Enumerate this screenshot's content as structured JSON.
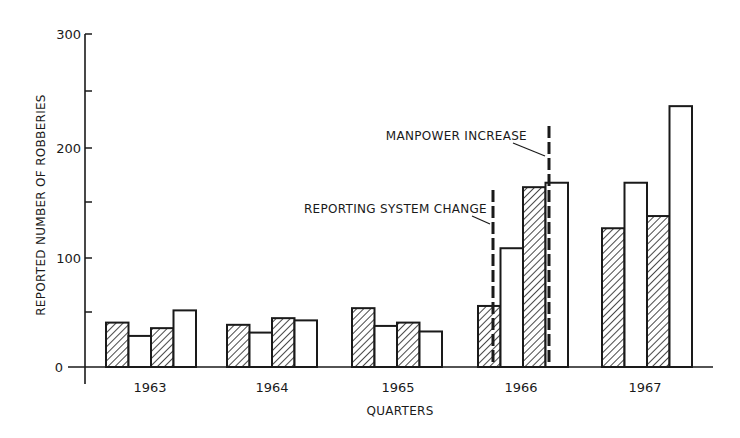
{
  "chart_data": {
    "type": "bar",
    "title": "",
    "xlabel": "QUARTERS",
    "ylabel": "REPORTED NUMBER OF ROBBERIES",
    "ylim": [
      0,
      300
    ],
    "yticks": [
      0,
      100,
      200,
      300
    ],
    "yminor_ticks": [
      50,
      150,
      250
    ],
    "grid": false,
    "legend": null,
    "categories": [
      "1963",
      "1964",
      "1965",
      "1966",
      "1967"
    ],
    "quarters": [
      "Q1",
      "Q2",
      "Q3",
      "Q4"
    ],
    "bar_styles": [
      "hatched",
      "open",
      "hatched",
      "open"
    ],
    "values": [
      [
        40,
        28,
        35,
        51
      ],
      [
        38,
        31,
        44,
        42
      ],
      [
        53,
        37,
        40,
        32
      ],
      [
        55,
        107,
        162,
        166
      ],
      [
        125,
        166,
        136,
        235
      ]
    ],
    "annotations": [
      {
        "text": "REPORTING SYSTEM CHANGE",
        "position": "between 1966 Q1 and Q2",
        "style": "dashed vertical line"
      },
      {
        "text": "MANPOWER INCREASE",
        "position": "between 1966 Q3 and Q4",
        "style": "dashed vertical line"
      }
    ]
  },
  "labels": {
    "y_axis": "REPORTED NUMBER OF ROBBERIES",
    "x_axis": "QUARTERS",
    "y_ticks": [
      "0",
      "100",
      "200",
      "300"
    ],
    "years": [
      "1963",
      "1964",
      "1965",
      "1966",
      "1967"
    ],
    "annotation_reporting": "REPORTING SYSTEM CHANGE",
    "annotation_manpower": "MANPOWER INCREASE"
  },
  "colors": {
    "ink": "#1a1a1a",
    "background": "#ffffff"
  }
}
